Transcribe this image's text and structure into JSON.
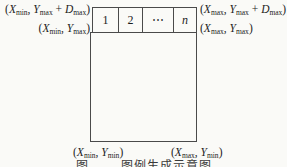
{
  "figure": {
    "strip_cells": [
      "1",
      "2",
      "⋯",
      "n"
    ],
    "labels": {
      "top_left_outer": "(X_min, Y_max + D_max)",
      "top_right_outer": "(X_max, Y_max + D_max)",
      "top_left_inner": "(X_min, Y_max)",
      "top_right_inner": "(X_max, Y_max)",
      "bottom_left": "(X_min, Y_min)",
      "bottom_right": "(X_max, Y_min)"
    },
    "caption": {
      "fig_word": "图",
      "title": "图例生成示意图"
    },
    "colors": {
      "line": "#4a4a4a",
      "text": "#1d1d1d",
      "background": "#fafaf7"
    }
  }
}
